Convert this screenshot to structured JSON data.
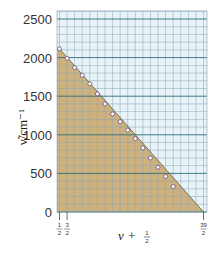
{
  "chart_data": {
    "type": "line",
    "title": "",
    "xlabel": "v + 1/2",
    "ylabel": "ν̃/cm⁻¹",
    "xlim": [
      0.3,
      20.0
    ],
    "ylim": [
      0,
      2600
    ],
    "grid": true,
    "fill_under": true,
    "x_ticks": [
      {
        "value": 0.5,
        "label_num": "1",
        "label_den": "2"
      },
      {
        "value": 1.5,
        "label_num": "3",
        "label_den": "2"
      },
      {
        "value": 19.5,
        "label_num": "39",
        "label_den": "2"
      }
    ],
    "y_ticks": [
      0,
      500,
      1000,
      1500,
      2000,
      2500
    ],
    "series": [
      {
        "name": "ΔG(v+½)",
        "marker": "open-circle",
        "x": [
          0.5,
          1.5,
          2.5,
          3.5,
          4.5,
          5.5,
          6.5,
          7.5,
          8.5,
          9.5,
          10.5,
          11.5,
          12.5,
          13.5,
          14.5,
          15.5
        ],
        "values": [
          2115,
          1990,
          1870,
          1770,
          1660,
          1530,
          1400,
          1270,
          1170,
          1060,
          950,
          830,
          700,
          580,
          460,
          330
        ]
      }
    ],
    "extrapolated_line": {
      "x": [
        0.5,
        19.5
      ],
      "values": [
        2115,
        0
      ]
    }
  },
  "colors": {
    "fill": "#cdb27f",
    "background": "#e8f3f8",
    "minor_grid": "#8aa6b6",
    "major_grid": "#2f6f7a",
    "marker_fill": "#ffffff",
    "marker_stroke": "#6a4c7a"
  },
  "labels": {
    "y_title": "ν̃/cm⁻¹",
    "x_title_v": "v",
    "x_title_plus": " + ",
    "x_title_num": "1",
    "x_title_den": "2"
  }
}
